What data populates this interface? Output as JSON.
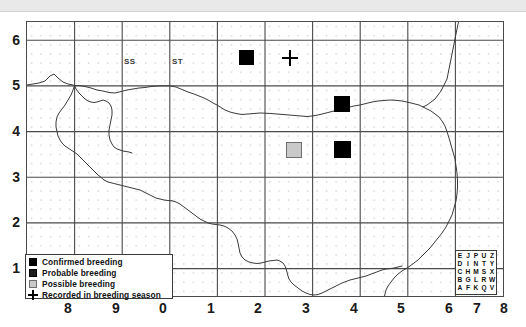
{
  "map": {
    "title": "",
    "grid_labels": [
      {
        "text": "SS",
        "x": 2.05,
        "y": 5.55
      },
      {
        "text": "ST",
        "x": 3.05,
        "y": 5.55
      }
    ],
    "axes": {
      "x_ticks": [
        "8",
        "9",
        "0",
        "1",
        "2",
        "3",
        "4",
        "5",
        "6",
        "7",
        "8"
      ],
      "y_ticks": [
        "6",
        "5",
        "4",
        "3",
        "2",
        "1"
      ],
      "x_range": [
        0,
        10
      ],
      "y_range": [
        0.4,
        6.4
      ]
    },
    "records": [
      {
        "x": 2.5,
        "y": 5.5,
        "status": "confirmed"
      },
      {
        "x": 4.5,
        "y": 4.5,
        "status": "confirmed"
      },
      {
        "x": 4.5,
        "y": 3.5,
        "status": "confirmed"
      },
      {
        "x": 3.5,
        "y": 3.5,
        "status": "possible"
      },
      {
        "x": 3.42,
        "y": 5.52,
        "status": "recorded"
      }
    ]
  },
  "legend": {
    "items": [
      {
        "swatch": "confirmed",
        "label": "Confirmed breeding"
      },
      {
        "swatch": "probable",
        "label": "Probable breeding"
      },
      {
        "swatch": "possible",
        "label": "Possible breeding"
      },
      {
        "swatch": "recorded",
        "label": "Recorded in breeding season"
      }
    ]
  },
  "letter_key": {
    "rows": [
      [
        "E",
        "J",
        "P",
        "U",
        "Z"
      ],
      [
        "D",
        "I",
        "N",
        "T",
        "Y"
      ],
      [
        "C",
        "H",
        "M",
        "S",
        "X"
      ],
      [
        "B",
        "G",
        "L",
        "R",
        "W"
      ],
      [
        "A",
        "F",
        "K",
        "Q",
        "V"
      ]
    ]
  },
  "colors": {
    "confirmed": "#000000",
    "probable": "#1c1c1c",
    "possible": "#c9c9c9",
    "possible_border": "#6e6e6e",
    "grid_major": "#4a4a4a",
    "grid_dot": "#b8b8b8",
    "coastline": "#3a3a3a",
    "banner": "#e9e9e9"
  }
}
